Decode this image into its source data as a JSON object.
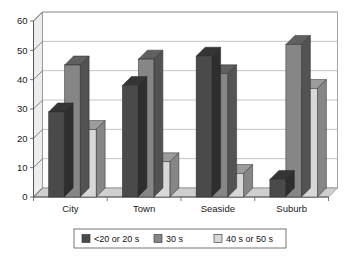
{
  "chart_data": {
    "type": "bar",
    "title": "",
    "subtitle": "",
    "xlabel": "",
    "ylabel": "",
    "categories": [
      "City",
      "Town",
      "Seaside",
      "Suburb"
    ],
    "series": [
      {
        "name": "<20 or 20 s",
        "color": "#4a4a4a",
        "values": [
          29,
          38,
          48,
          6
        ]
      },
      {
        "name": "30 s",
        "color": "#868686",
        "values": [
          45,
          47,
          42,
          52
        ]
      },
      {
        "name": "40 s or 50 s",
        "color": "#d8d8d8",
        "values": [
          23,
          12,
          8,
          37
        ]
      }
    ],
    "ylim": [
      0,
      60
    ],
    "yticks": [
      0,
      10,
      20,
      30,
      40,
      50,
      60
    ],
    "ytick_labels": [
      "0",
      "10",
      "20",
      "30",
      "40",
      "50",
      "60"
    ],
    "grid": true,
    "grid_axis": "y",
    "legend_position": "bottom",
    "style": "3d-column",
    "plot_background": "#ffffff",
    "gridline_color": "#aaaaaa",
    "axis_color": "#555555"
  },
  "legend": {
    "items": [
      {
        "label": "<20 or 20 s",
        "swatch": "#4a4a4a"
      },
      {
        "label": "30 s",
        "swatch": "#868686"
      },
      {
        "label": "40 s or 50 s",
        "swatch": "#d8d8d8"
      }
    ]
  },
  "axis": {
    "y_tick_0": "0",
    "y_tick_1": "10",
    "y_tick_2": "20",
    "y_tick_3": "30",
    "y_tick_4": "40",
    "y_tick_5": "50",
    "y_tick_6": "60"
  },
  "categories": {
    "c0": "City",
    "c1": "Town",
    "c2": "Seaside",
    "c3": "Suburb"
  }
}
